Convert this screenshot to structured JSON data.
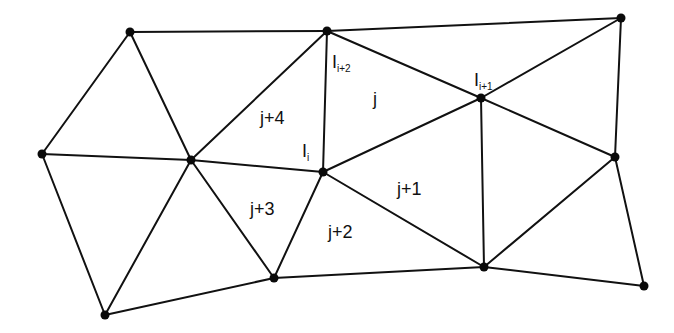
{
  "diagram": {
    "type": "triangular-mesh",
    "nodes": [
      {
        "id": "A",
        "x": 130,
        "y": 32
      },
      {
        "id": "B",
        "x": 327,
        "y": 31
      },
      {
        "id": "C",
        "x": 42,
        "y": 154
      },
      {
        "id": "D",
        "x": 191,
        "y": 160
      },
      {
        "id": "E",
        "x": 323,
        "y": 172
      },
      {
        "id": "F",
        "x": 274,
        "y": 278
      },
      {
        "id": "G",
        "x": 105,
        "y": 315
      },
      {
        "id": "H",
        "x": 621,
        "y": 18
      },
      {
        "id": "I",
        "x": 481,
        "y": 98
      },
      {
        "id": "J",
        "x": 615,
        "y": 157
      },
      {
        "id": "K",
        "x": 484,
        "y": 267
      },
      {
        "id": "L",
        "x": 644,
        "y": 286
      }
    ],
    "edges": [
      [
        "A",
        "B"
      ],
      [
        "A",
        "C"
      ],
      [
        "A",
        "D"
      ],
      [
        "B",
        "D"
      ],
      [
        "B",
        "E"
      ],
      [
        "B",
        "H"
      ],
      [
        "B",
        "I"
      ],
      [
        "C",
        "D"
      ],
      [
        "C",
        "G"
      ],
      [
        "D",
        "E"
      ],
      [
        "D",
        "F"
      ],
      [
        "D",
        "G"
      ],
      [
        "G",
        "F"
      ],
      [
        "E",
        "F"
      ],
      [
        "E",
        "I"
      ],
      [
        "E",
        "K"
      ],
      [
        "F",
        "K"
      ],
      [
        "H",
        "I"
      ],
      [
        "H",
        "J"
      ],
      [
        "I",
        "J"
      ],
      [
        "I",
        "K"
      ],
      [
        "J",
        "K"
      ],
      [
        "J",
        "L"
      ],
      [
        "K",
        "L"
      ]
    ],
    "labels": {
      "node_i": {
        "base": "I",
        "sub": "i",
        "x": 302,
        "y": 157
      },
      "node_i1": {
        "base": "I",
        "sub": "i+1",
        "x": 474,
        "y": 86
      },
      "node_i2": {
        "base": "I",
        "sub": "i+2",
        "x": 332,
        "y": 68
      },
      "tri_j": {
        "text": "j",
        "x": 373,
        "y": 105
      },
      "tri_j1": {
        "text": "j+1",
        "x": 397,
        "y": 195
      },
      "tri_j2": {
        "text": "j+2",
        "x": 328,
        "y": 238
      },
      "tri_j3": {
        "text": "j+3",
        "x": 250,
        "y": 215
      },
      "tri_j4": {
        "text": "j+4",
        "x": 260,
        "y": 124
      }
    }
  }
}
